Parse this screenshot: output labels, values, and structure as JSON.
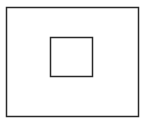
{
  "diagram": {
    "background": "#ffffff",
    "stroke_color": "#2a2a2a",
    "shapes": [
      {
        "id": "outer",
        "type": "rectangle",
        "x": 6,
        "y": 7,
        "width": 133,
        "height": 110,
        "stroke_width": 1.5
      },
      {
        "id": "inner",
        "type": "rectangle",
        "x": 50,
        "y": 37,
        "width": 43,
        "height": 40,
        "stroke_width": 1.5
      }
    ]
  }
}
